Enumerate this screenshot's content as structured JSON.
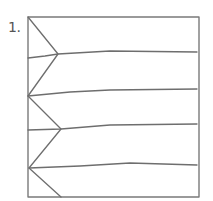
{
  "figure": {
    "label": "1.",
    "stroke_color": "#6e6e6e",
    "frame": {
      "x": 28,
      "y": 17,
      "width": 171,
      "height": 180
    },
    "zigzag_points": [
      [
        28,
        17
      ],
      [
        58,
        54
      ],
      [
        28,
        96
      ],
      [
        61,
        129
      ],
      [
        29,
        168
      ],
      [
        61,
        197
      ]
    ],
    "horizontal_lines": [
      {
        "points": [
          [
            28,
            58
          ],
          [
            58,
            54
          ],
          [
            110,
            51
          ],
          [
            197,
            52
          ]
        ]
      },
      {
        "points": [
          [
            28,
            96
          ],
          [
            110,
            90
          ],
          [
            197,
            89
          ]
        ]
      },
      {
        "points": [
          [
            28,
            130
          ],
          [
            61,
            129
          ],
          [
            110,
            125
          ],
          [
            197,
            124
          ]
        ]
      },
      {
        "points": [
          [
            29,
            168
          ],
          [
            110,
            164
          ],
          [
            197,
            165
          ]
        ]
      }
    ]
  }
}
